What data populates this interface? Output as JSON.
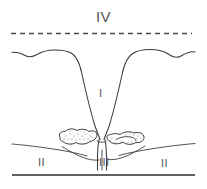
{
  "figure": {
    "type": "line-art cross-section diagram",
    "background_color": "#ffffff",
    "ink_color": "#3b3b3b",
    "width": 207,
    "height": 189
  },
  "labels": {
    "zone_iv": "IV",
    "zone_i": "I",
    "zone_ii_left": "II",
    "zone_ii_right": "II",
    "zone_iii": "III"
  },
  "elements": {
    "dashed_reference_line": "dashed-horizontal-line",
    "surface_contour_left": "wavy-surface-curve-left",
    "surface_contour_right": "wavy-surface-curve-right",
    "cleft_wall_left": "cleft-wall-left",
    "cleft_wall_right": "cleft-wall-right",
    "stippled_mass_left": "stippled-irregular-mass-left",
    "stippled_mass_right": "stippled-irregular-mass-right",
    "mid_contour_left": "mid-horizontal-contour-left",
    "mid_contour_right": "mid-horizontal-contour-right",
    "central_column": "central-column",
    "baseline": "baseline-horizontal-rule"
  }
}
